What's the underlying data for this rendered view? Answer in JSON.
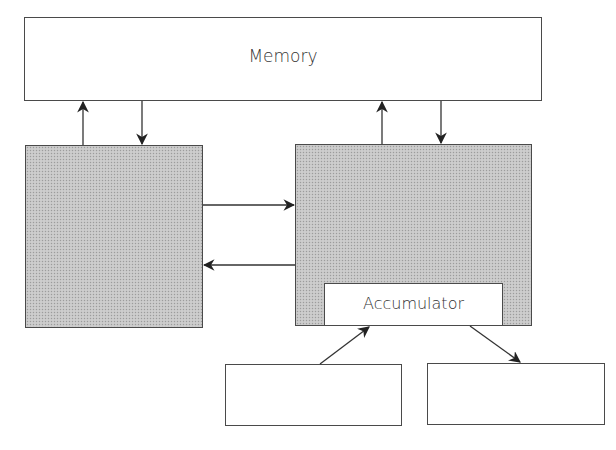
{
  "diagram": {
    "memory": {
      "label": "Memory"
    },
    "left_unit": {
      "label": ""
    },
    "right_unit": {
      "label": ""
    },
    "accumulator": {
      "label": "Accumulator"
    },
    "bottom_left": {
      "label": ""
    },
    "bottom_right": {
      "label": ""
    }
  },
  "colors": {
    "stroke": "#4a4a4a",
    "shade": "#c6c6c6",
    "background": "#ffffff"
  },
  "edges": [
    {
      "from": "left_unit",
      "to": "memory"
    },
    {
      "from": "memory",
      "to": "left_unit"
    },
    {
      "from": "right_unit",
      "to": "memory"
    },
    {
      "from": "memory",
      "to": "right_unit"
    },
    {
      "from": "left_unit",
      "to": "right_unit"
    },
    {
      "from": "right_unit",
      "to": "left_unit"
    },
    {
      "from": "bottom_left",
      "to": "accumulator"
    },
    {
      "from": "accumulator",
      "to": "bottom_right"
    }
  ]
}
